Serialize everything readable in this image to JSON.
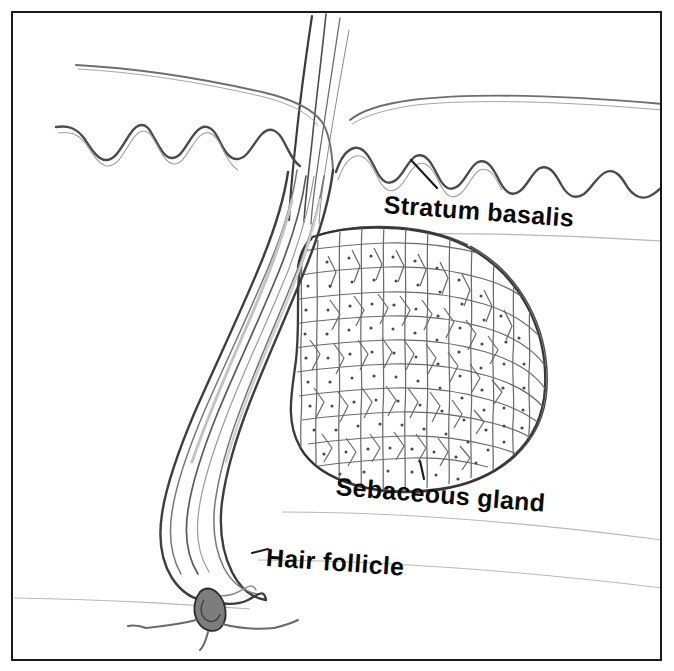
{
  "figure": {
    "kind": "histology-line-drawing",
    "background_color": "#ffffff",
    "ink_color": "#1a1a1a",
    "border": {
      "color": "#1a1a1a",
      "thickness_px": 2,
      "inset_px": 11
    }
  },
  "labels": {
    "stratum_basalis": "Stratum basalis",
    "sebaceous_gland": "Sebaceous gland",
    "hair_follicle": "Hair follicle"
  },
  "structures": [
    {
      "name": "hair-shaft",
      "description": "Thin hair shaft strands emerging above the skin surface at the top of the figure"
    },
    {
      "name": "skin-surface",
      "description": "Outer epidermal surface curve running across the upper left and dipping toward the follicle opening"
    },
    {
      "name": "stratum-basalis-line",
      "description": "Wavy undulating basal layer line separating epidermis from dermis"
    },
    {
      "name": "hair-follicle-canal",
      "description": "Multi-layered tube descending diagonally down and to the left from the skin surface"
    },
    {
      "name": "hair-bulb",
      "description": "Rounded expanded base of the follicle at the lower end"
    },
    {
      "name": "dermal-papilla",
      "description": "Small dark papilla with vessels indenting the base of the hair bulb"
    },
    {
      "name": "sebaceous-gland",
      "description": "Teardrop-shaped acinus packed with polygonal sebocytes, attached to the follicle by a short duct"
    },
    {
      "name": "dermal-guide-lines",
      "description": "Faint thin horizontal lines crossing the lower and right portions of the page"
    }
  ],
  "leader_lines": [
    {
      "name": "stratum-basalis-leader",
      "from_label": "Stratum basalis",
      "points_to": "stratum-basalis-line"
    },
    {
      "name": "sebaceous-gland-leader",
      "from_label": "Sebaceous gland",
      "points_to": "sebaceous-gland"
    },
    {
      "name": "hair-follicle-leader",
      "from_label": "Hair follicle",
      "points_to": "hair-follicle-canal"
    }
  ]
}
